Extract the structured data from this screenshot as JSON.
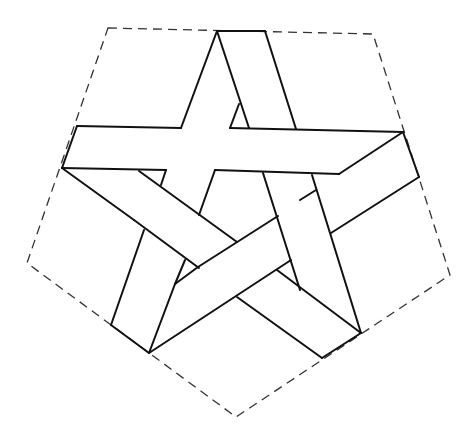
{
  "figure": {
    "title": "",
    "colors": {
      "line": "#111111",
      "dashed_outline": "#333333",
      "background": "#ffffff"
    },
    "pentagon_vertices": [
      [
        108,
        28
      ],
      [
        373,
        34
      ],
      [
        450,
        275
      ],
      [
        236,
        417
      ],
      [
        27,
        263
      ]
    ],
    "strip_count": 5
  }
}
